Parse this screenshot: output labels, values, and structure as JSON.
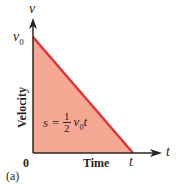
{
  "figure": {
    "panel_label": "(a)",
    "y_axis": {
      "name": "v",
      "title": "Velocity",
      "tick": "v",
      "tick_sub": "0"
    },
    "x_axis": {
      "name": "t",
      "title": "Time",
      "origin": "0",
      "tick": "t"
    },
    "area_label": {
      "lhs": "s =",
      "num": "1",
      "den": "2",
      "rhs": "v",
      "rhs_sub": "0",
      "rhs_tail": "t"
    },
    "colors": {
      "fill": "#f5a893",
      "line": "#e0323a",
      "axis": "#2b2623"
    }
  }
}
